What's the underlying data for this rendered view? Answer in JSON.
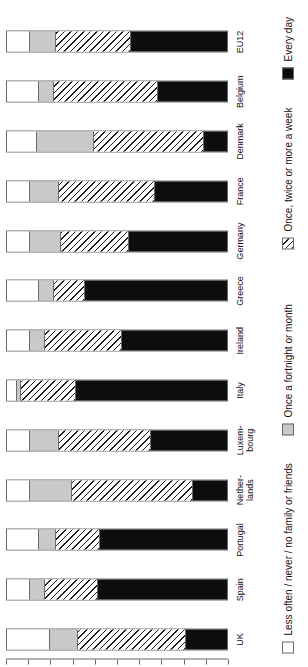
{
  "chart_data": {
    "type": "bar",
    "subtype": "stacked-horizontal-100percent",
    "orientation": "rotated-90-counterclockwise",
    "title": "",
    "xlabel": "",
    "ylabel": "",
    "ylim": [
      0,
      100
    ],
    "grid": false,
    "legend_position": "right-side (rotated, runs along page edge)",
    "axis_tick_labels": [
      "100%",
      "90%",
      "80%",
      "70%",
      "60%",
      "50%",
      "40%",
      "30%",
      "20%",
      "10%",
      "0%"
    ],
    "axis_tick_values": [
      100,
      90,
      80,
      70,
      60,
      50,
      40,
      30,
      20,
      10,
      0
    ],
    "categories": [
      "UK",
      "Spain",
      "Portugal",
      "Nether-\nlands",
      "Luxem-\nbourg",
      "Italy",
      "Ireland",
      "Greece",
      "Germany",
      "France",
      "Denmark",
      "Belgium",
      "EU12"
    ],
    "series": [
      {
        "name": "Less often / never / no family or friends",
        "key": "less_often",
        "color": "#ffffff",
        "pattern": "solid-white",
        "values": [
          19,
          10,
          14,
          10,
          10,
          4,
          10,
          14,
          10,
          10,
          13,
          14,
          10
        ]
      },
      {
        "name": "Once a fortnight or month",
        "key": "fortnight_month",
        "color": "#c9c9c9",
        "pattern": "solid-gray",
        "values": [
          13,
          7,
          8,
          19,
          13,
          2,
          7,
          7,
          14,
          13,
          26,
          7,
          12
        ]
      },
      {
        "name": "Once, twice or more a week",
        "key": "week",
        "color": "#ffffff",
        "pattern": "diagonal-hatch",
        "values": [
          49,
          24,
          20,
          55,
          42,
          25,
          35,
          14,
          31,
          44,
          50,
          47,
          34
        ]
      },
      {
        "name": "Every day",
        "key": "every_day",
        "color": "#0d0d0d",
        "pattern": "solid-black",
        "values": [
          19,
          59,
          58,
          16,
          35,
          69,
          48,
          65,
          45,
          33,
          11,
          32,
          44
        ]
      }
    ]
  },
  "legend": {
    "items": [
      {
        "label": "Less often / never / no family or friends",
        "swatch": "white-swatch"
      },
      {
        "label": "Once a fortnight or month",
        "swatch": "gray-swatch"
      },
      {
        "label": "Once, twice or more a week",
        "swatch": "hatched-swatch"
      },
      {
        "label": "Every day",
        "swatch": "black-swatch"
      }
    ]
  }
}
